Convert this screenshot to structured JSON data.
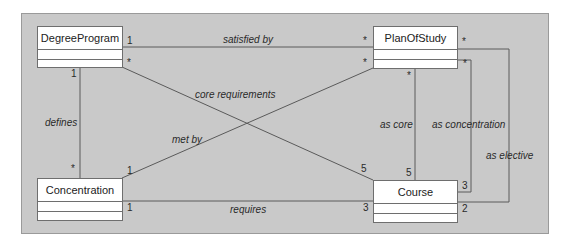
{
  "diagram": {
    "type": "uml-class-diagram",
    "classes": [
      {
        "id": "degree_program",
        "name": "DegreeProgram"
      },
      {
        "id": "plan_of_study",
        "name": "PlanOfStudy"
      },
      {
        "id": "concentration",
        "name": "Concentration"
      },
      {
        "id": "course",
        "name": "Course"
      }
    ],
    "associations": [
      {
        "id": "satisfied_by",
        "label": "satisfied by",
        "from": "DegreeProgram",
        "to": "PlanOfStudy",
        "from_mult": "1",
        "to_mult": "*"
      },
      {
        "id": "core_requirements",
        "label": "core requirements",
        "from": "DegreeProgram",
        "to": "Course",
        "from_mult": "*",
        "to_mult": "5"
      },
      {
        "id": "defines",
        "label": "defines",
        "from": "DegreeProgram",
        "to": "Concentration",
        "from_mult": "1",
        "to_mult": "*"
      },
      {
        "id": "met_by",
        "label": "met by",
        "from": "Concentration",
        "to": "PlanOfStudy",
        "from_mult": "1",
        "to_mult": "*"
      },
      {
        "id": "requires",
        "label": "requires",
        "from": "Concentration",
        "to": "Course",
        "from_mult": "1",
        "to_mult": "3"
      },
      {
        "id": "as_core",
        "label": "as core",
        "from": "PlanOfStudy",
        "to": "Course",
        "from_mult": "*",
        "to_mult": "5"
      },
      {
        "id": "as_concentration",
        "label": "as concentration",
        "from": "PlanOfStudy",
        "to": "Course",
        "from_mult": "*",
        "to_mult": "3"
      },
      {
        "id": "as_elective",
        "label": "as elective",
        "from": "PlanOfStudy",
        "to": "Course",
        "from_mult": "*",
        "to_mult": "2"
      }
    ]
  },
  "colors": {
    "panel": "#c9c9c9",
    "line": "#5a5a5a",
    "box": "#ffffff"
  }
}
